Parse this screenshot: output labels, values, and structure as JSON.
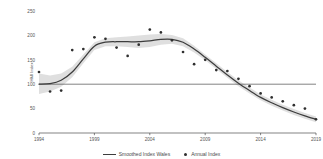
{
  "chart_data": {
    "type": "line",
    "title": "",
    "xlabel": "",
    "ylabel": "HMI Index",
    "xlim": [
      1994,
      2019
    ],
    "ylim": [
      0,
      250
    ],
    "grid": false,
    "legend_position": "bottom-center",
    "xticks": [
      "1994",
      "1999",
      "2004",
      "2009",
      "2014",
      "2019"
    ],
    "xtick_values": [
      1994,
      1999,
      2004,
      2009,
      2014,
      2019
    ],
    "yticks": [
      "0",
      "50",
      "100",
      "150",
      "200",
      "250"
    ],
    "ytick_values": [
      0,
      50,
      100,
      150,
      200,
      250
    ],
    "reference_line": {
      "y": 100,
      "label": ""
    },
    "x": [
      1994,
      1995,
      1996,
      1997,
      1998,
      1999,
      2000,
      2001,
      2002,
      2003,
      2004,
      2005,
      2006,
      2007,
      2008,
      2009,
      2010,
      2011,
      2012,
      2013,
      2014,
      2015,
      2016,
      2017,
      2018,
      2019
    ],
    "series": [
      {
        "name": "Smoothed Index Wales",
        "type": "line",
        "color": "#3d3d3d",
        "values": [
          100,
          101,
          108,
          125,
          152,
          178,
          186,
          187,
          187,
          187,
          189,
          192,
          192,
          186,
          172,
          155,
          137,
          119,
          102,
          87,
          73,
          62,
          52,
          43,
          35,
          28
        ]
      },
      {
        "name": "Annual Index",
        "type": "scatter",
        "color": "#2f2f2f",
        "values": [
          125,
          85,
          87,
          170,
          172,
          196,
          193,
          175,
          158,
          181,
          212,
          206,
          190,
          166,
          141,
          150,
          129,
          127,
          111,
          96,
          81,
          73,
          65,
          57,
          50,
          28
        ]
      }
    ],
    "confidence_band": {
      "name": "95% confidence band",
      "color": "#cccccc",
      "upper": [
        122,
        118,
        122,
        136,
        161,
        186,
        194,
        196,
        198,
        200,
        202,
        203,
        201,
        194,
        179,
        161,
        143,
        125,
        108,
        93,
        79,
        68,
        58,
        49,
        41,
        34
      ],
      "lower": [
        80,
        85,
        95,
        114,
        143,
        170,
        178,
        178,
        176,
        174,
        176,
        181,
        183,
        178,
        165,
        149,
        131,
        113,
        96,
        81,
        67,
        56,
        46,
        37,
        29,
        22
      ]
    },
    "legend": [
      {
        "label": "Smoothed Index Wales",
        "marker": "line"
      },
      {
        "label": "Annual Index",
        "marker": "dot"
      }
    ]
  }
}
